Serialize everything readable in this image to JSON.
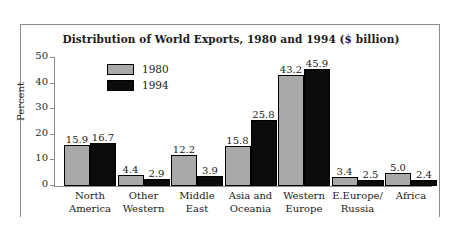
{
  "chart_data": {
    "type": "bar",
    "title": "Distribution of World Exports, 1980 and 1994 ($ billion)",
    "xlabel": "",
    "ylabel": "Percent",
    "ylim": [
      0,
      50
    ],
    "yticks": [
      0,
      10,
      20,
      30,
      40,
      50
    ],
    "grid": false,
    "legend_position": "inside-upper-left",
    "categories": [
      "North America",
      "Other Western",
      "Middle East",
      "Asia and Oceania",
      "Western Europe",
      "E.Europe/ Russia",
      "Africa"
    ],
    "category_lines": [
      [
        "North",
        "America"
      ],
      [
        "Other",
        "Western"
      ],
      [
        "Middle",
        "East"
      ],
      [
        "Asia and",
        "Oceania"
      ],
      [
        "Western",
        "Europe"
      ],
      [
        "E.Europe/",
        "Russia"
      ],
      [
        "Africa",
        ""
      ]
    ],
    "series": [
      {
        "name": "1980",
        "color": "#a9a9a9",
        "values": [
          15.9,
          4.4,
          12.2,
          15.8,
          43.2,
          3.4,
          5.0
        ],
        "labels": [
          "15.9",
          "4.4",
          "12.2",
          "15.8",
          "43.2",
          "3.4",
          "5.0"
        ]
      },
      {
        "name": "1994",
        "color": "#0b0b0b",
        "values": [
          16.7,
          2.9,
          3.9,
          25.8,
          45.9,
          2.5,
          2.4
        ],
        "labels": [
          "16.7",
          "2.9",
          "3.9",
          "25.8",
          "45.9",
          "2.5",
          "2.4"
        ]
      }
    ]
  }
}
